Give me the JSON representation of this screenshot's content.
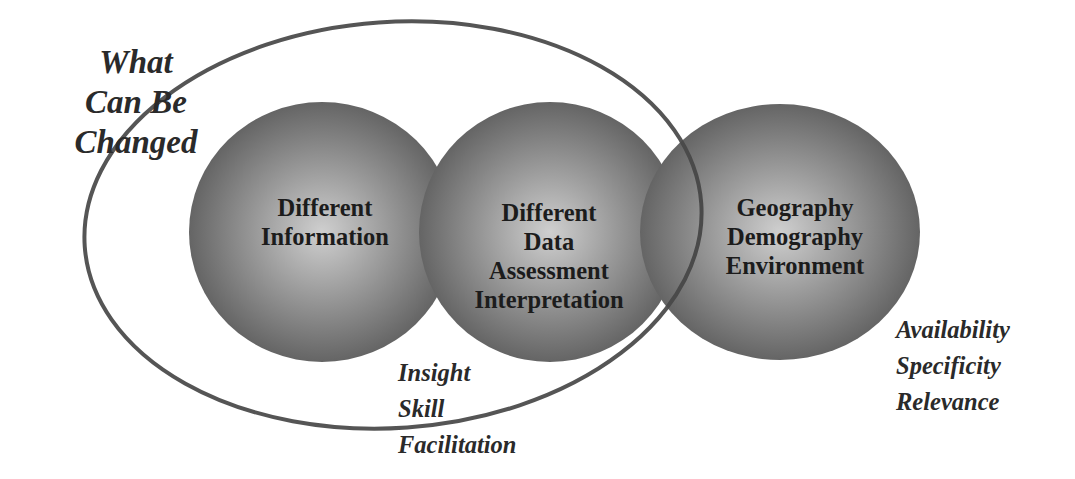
{
  "diagram": {
    "title_lines": [
      "What",
      "Can Be",
      "Changed"
    ],
    "circles": [
      {
        "id": "information",
        "lines": [
          "Different",
          "Information"
        ]
      },
      {
        "id": "data",
        "lines": [
          "Different",
          "Data",
          "Assessment",
          "Interpretation"
        ]
      },
      {
        "id": "context",
        "lines": [
          "Geography",
          "Demography",
          "Environment"
        ]
      }
    ],
    "annotations": {
      "human_factors": [
        "Insight",
        "Skill",
        "Facilitation"
      ],
      "data_qualities": [
        "Availability",
        "Specificity",
        "Relevance"
      ]
    },
    "colors": {
      "circle_center": "#c8c8c8",
      "circle_edge": "#5a5a5a",
      "ellipse_stroke": "#555555",
      "text": "#1c1c1c",
      "background": "#ffffff"
    }
  }
}
